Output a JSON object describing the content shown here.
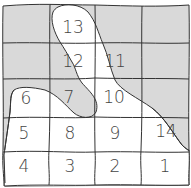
{
  "diagram": {
    "type": "hand-drawn grid map",
    "grid": {
      "rows": 5,
      "cols": 4
    },
    "colors": {
      "shaded": "#d9d9d9",
      "unshaded": "#ffffff",
      "line": "#333333",
      "text": "#444444"
    },
    "cells": [
      {
        "label": "",
        "row": 0,
        "col": 0,
        "x": 26,
        "y": 24
      },
      {
        "label": "13",
        "row": 0,
        "col": 1,
        "x": 73,
        "y": 27
      },
      {
        "label": "",
        "row": 0,
        "col": 2,
        "x": 119,
        "y": 24
      },
      {
        "label": "",
        "row": 0,
        "col": 3,
        "x": 165,
        "y": 24
      },
      {
        "label": "",
        "row": 1,
        "col": 0,
        "x": 26,
        "y": 60
      },
      {
        "label": "12",
        "row": 1,
        "col": 1,
        "x": 73,
        "y": 61
      },
      {
        "label": "11",
        "row": 1,
        "col": 2,
        "x": 115,
        "y": 61
      },
      {
        "label": "",
        "row": 1,
        "col": 3,
        "x": 165,
        "y": 60
      },
      {
        "label": "6",
        "row": 2,
        "col": 0,
        "x": 26,
        "y": 98
      },
      {
        "label": "7",
        "row": 2,
        "col": 1,
        "x": 69,
        "y": 97
      },
      {
        "label": "10",
        "row": 2,
        "col": 2,
        "x": 114,
        "y": 97
      },
      {
        "label": "",
        "row": 2,
        "col": 3,
        "x": 165,
        "y": 98
      },
      {
        "label": "5",
        "row": 3,
        "col": 0,
        "x": 24,
        "y": 133
      },
      {
        "label": "8",
        "row": 3,
        "col": 1,
        "x": 70,
        "y": 133
      },
      {
        "label": "9",
        "row": 3,
        "col": 2,
        "x": 115,
        "y": 133
      },
      {
        "label": "14",
        "row": 3,
        "col": 3,
        "x": 166,
        "y": 131
      },
      {
        "label": "4",
        "row": 4,
        "col": 0,
        "x": 24,
        "y": 166
      },
      {
        "label": "3",
        "row": 4,
        "col": 1,
        "x": 70,
        "y": 166
      },
      {
        "label": "2",
        "row": 4,
        "col": 2,
        "x": 115,
        "y": 166
      },
      {
        "label": "1",
        "row": 4,
        "col": 3,
        "x": 165,
        "y": 166
      }
    ]
  }
}
